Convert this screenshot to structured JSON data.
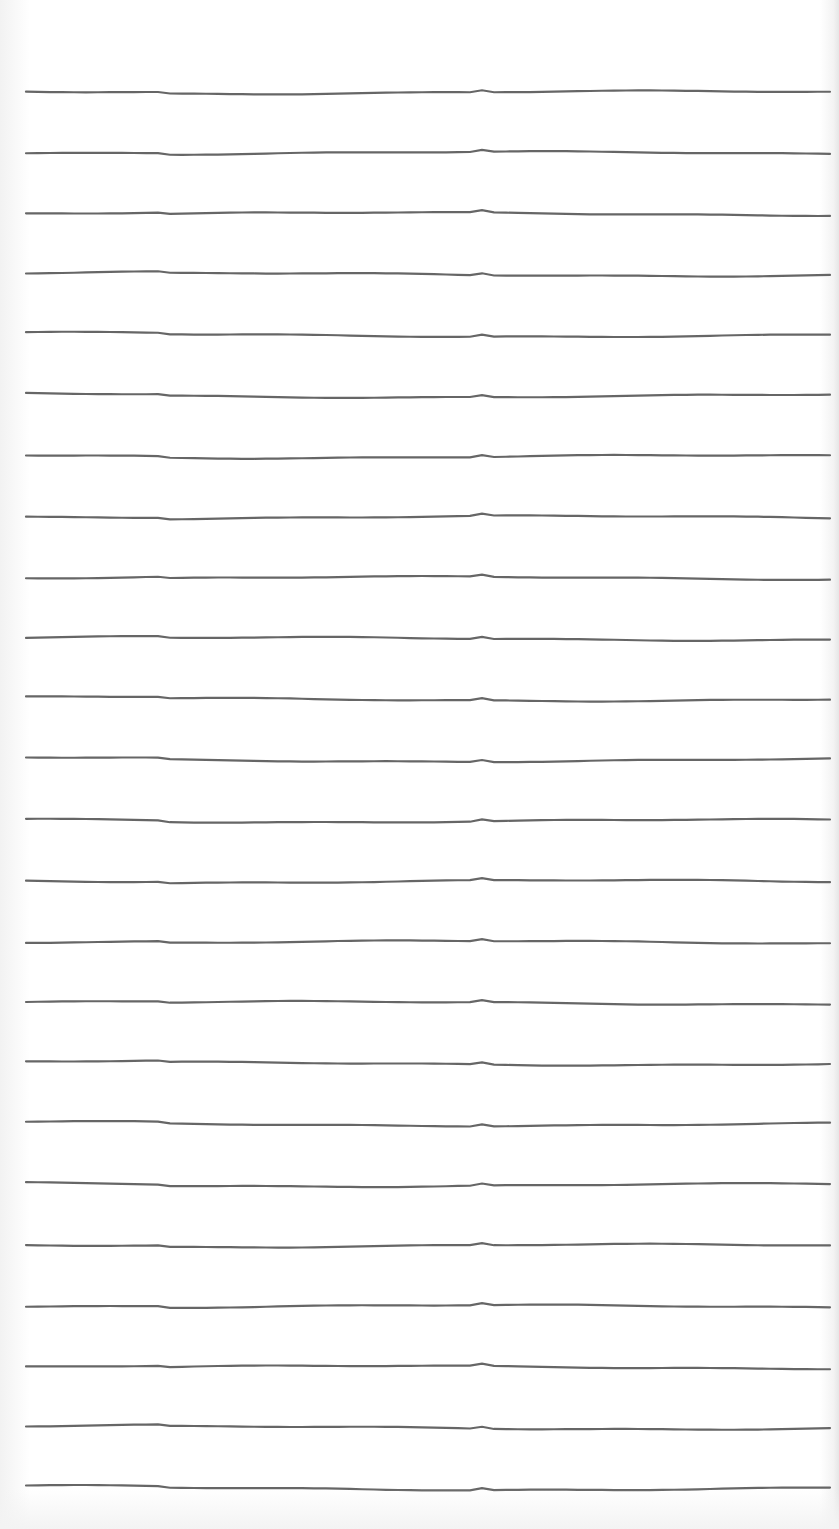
{
  "paper": {
    "type": "ruled-lined-paper",
    "line_count": 24,
    "line_color": "#666666",
    "background_color": "#ffffff",
    "first_line_y": 91,
    "line_spacing": 60.7,
    "line_start_x": 26,
    "line_end_x": 839
  }
}
